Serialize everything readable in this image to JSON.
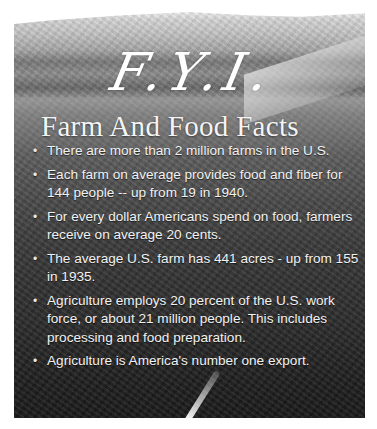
{
  "poster": {
    "title": "F.Y.I.",
    "subtitle": "Farm And Food Facts",
    "bullet_glyph": "•",
    "facts": [
      "There are more than 2 million farms in the U.S.",
      "Each farm on average provides food and fiber for 144 people -- up  from 19 in 1940.",
      "For every dollar Americans spend on food, farmers receive on average 20 cents.",
      "The average U.S. farm has 441 acres - up from 155 in 1935.",
      "Agriculture employs 20 percent of the U.S. work force, or about  21 million people. This includes processing and food preparation.",
      "Agriculture is America's number one export."
    ],
    "background": "grayscale farm landscape photo: wooded hills, barns, meadow, tall grass foreground",
    "colors": {
      "text": "#ffffff",
      "page_background": "#ffffff"
    }
  }
}
